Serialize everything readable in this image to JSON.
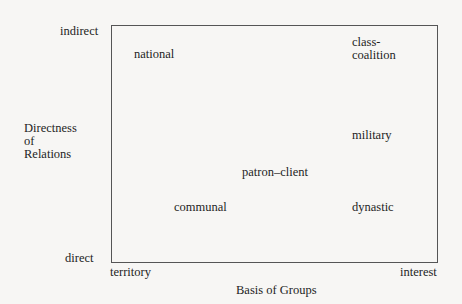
{
  "y_axis": {
    "top_label": "indirect",
    "bottom_label": "direct",
    "title": "Directness\nof\nRelations"
  },
  "x_axis": {
    "left_label": "territory",
    "right_label": "interest",
    "title": "Basis of Groups"
  },
  "items": [
    {
      "label": "national"
    },
    {
      "label": "class-\ncoalition"
    },
    {
      "label": "military"
    },
    {
      "label": "patron–client"
    },
    {
      "label": "communal"
    },
    {
      "label": "dynastic"
    }
  ]
}
